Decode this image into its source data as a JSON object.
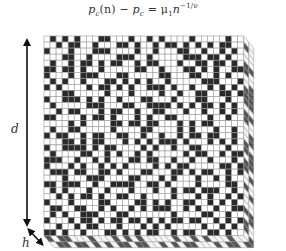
{
  "formula": {
    "lhs_p": "p",
    "lhs_sub": "c",
    "lhs_arg": "(n)",
    "minus": " − ",
    "rhs_p": "p",
    "rhs_sub": "c",
    "eq": " = ",
    "mu": "μ",
    "mu_sub": "1",
    "n": "n",
    "exp": "−1/ν"
  },
  "labels": {
    "depth": "d",
    "height": "h"
  },
  "colors": {
    "occupied": "#2a2a2a",
    "empty": "#ffffff",
    "gridline": "#9a9a9a",
    "arrow": "#111111"
  },
  "lattice": {
    "cols": 33,
    "rows": 33,
    "cell_px": 6.05,
    "origin_x": 44,
    "origin_y": 36,
    "depth_cells": 2,
    "grid": [
      "010101000110001001010000100000100",
      "001011001000110100101101010101100",
      "100010001110000100100011001001010",
      "000110010000111001000001110110100",
      "010010110101100101100010011011010",
      "110110100100000110010001101010011",
      "100010111000110000011000110010100",
      "010100100011010101001000001110001",
      "101000010110101001110100100101010",
      "000110000010001000010010011001101",
      "100111010100100011000100011000100",
      "010000011100011001111010101101010",
      "001011000101100100110001001001010",
      "110000101101000101001100000100100",
      "000010100001101101100010101100000",
      "010011000001000011000010100010010",
      "101100101100110010010010110110010",
      "000110101100010101011101000101010",
      "100111101011000010100100110000100",
      "010000110010100101000001011001011",
      "111001001010001101100100100100010",
      "100010100101010000101011000001101",
      "011101100110100011000110101100101",
      "000100011100001100010100010010100",
      "110111001001111001101000010000110",
      "010100010010001000100101101110010",
      "001010110100110010000100010100101",
      "100010000110000110101001100101010",
      "011001100101001010111001010010011",
      "010100111000110000000100001100100",
      "100010110101101101010110110010101",
      "001001011000100010101000001001010",
      "110100100011010101100101100110100"
    ]
  }
}
